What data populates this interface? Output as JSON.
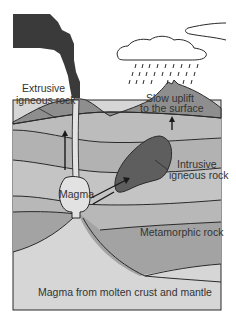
{
  "diagram": {
    "labels": {
      "extrusive_line1": "Extrusive",
      "extrusive_line2": "igneous rock",
      "uplift_line1": "Slow uplift",
      "uplift_line2": "to the surface",
      "intrusive_line1": "Intrusive",
      "intrusive_line2": "igneous rock",
      "magma": "Magma",
      "metamorphic": "Metamorphic rock",
      "source": "Magma from molten crust and mantle"
    },
    "elements": [
      "smoke-plume",
      "cloud",
      "rain",
      "volcano-surface",
      "rock-layers",
      "magma-chamber",
      "conduit",
      "intrusion",
      "arrows"
    ],
    "colors": {
      "smoke": "#3a3a3a",
      "surface": "#8c8c8c",
      "layer_light": "#bdbdbd",
      "layer_mid": "#a8a8a8",
      "metamorphic": "#9e9e9e",
      "magma": "#e2e2e2",
      "source": "#d6d6d6",
      "intrusion": "#5e5e5e",
      "outline": "#2a2a2a"
    }
  }
}
